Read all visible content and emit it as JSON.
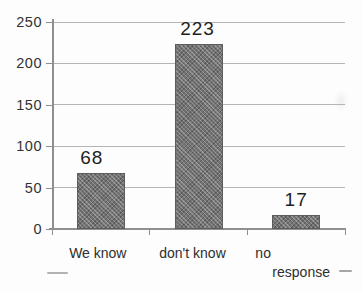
{
  "figure": {
    "background": "#fdfdfd",
    "bar_color": "#747474",
    "bar_border_color": "#5d5d5d",
    "gridline_color": "#b5b5b5",
    "axis_color": "#8f8f8f",
    "tick_color": "#8f8f8f",
    "axis_label_color": "#333333",
    "value_label_color": "#1f1f1f",
    "category_label_color": "#2e2e2e"
  },
  "chart_data": {
    "type": "bar",
    "title": "",
    "xlabel": "",
    "ylabel": "",
    "categories": [
      "We know",
      "don't know",
      "no response"
    ],
    "categories_display": [
      [
        "We know"
      ],
      [
        "don't know"
      ],
      [
        "no",
        "response"
      ]
    ],
    "values": [
      68,
      223,
      17
    ],
    "data_labels": [
      "68",
      "223",
      "17"
    ],
    "ylim": [
      0,
      250
    ],
    "yticks": [
      0,
      50,
      100,
      150,
      200,
      250
    ],
    "ytick_labels": [
      "0",
      "50",
      "100",
      "150",
      "200",
      "250"
    ],
    "grid": true,
    "legend": false,
    "bar_texture": "halftone-crosshatch",
    "appearance": "scanned-print"
  }
}
